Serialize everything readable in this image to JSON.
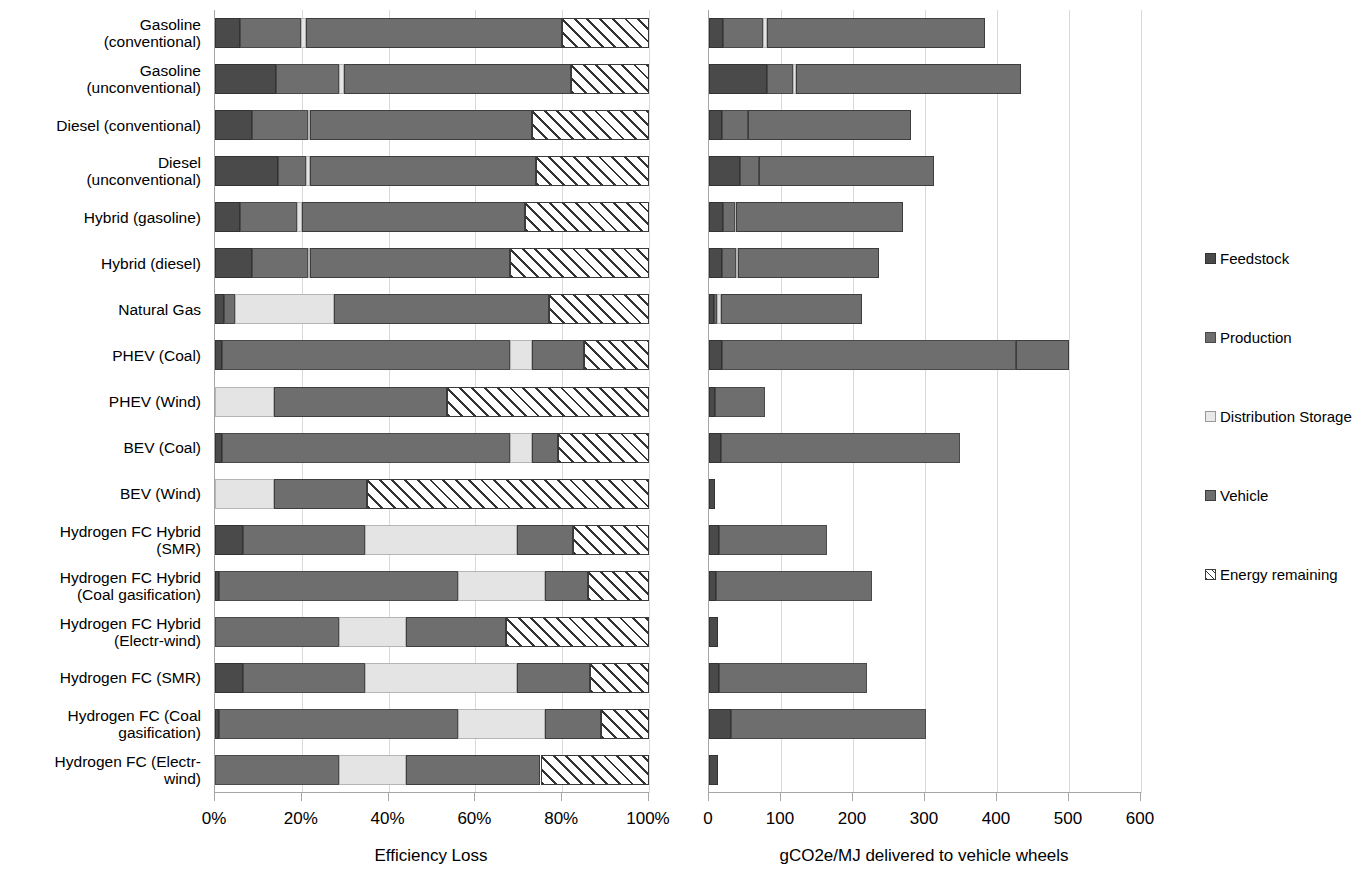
{
  "chart_data": {
    "type": "bar",
    "subtype": "horizontal stacked bar, two panels",
    "title": "",
    "categories": [
      "Gasoline (conventional)",
      "Gasoline (unconventional)",
      "Diesel (conventional)",
      "Diesel (unconventional)",
      "Hybrid (gasoline)",
      "Hybrid (diesel)",
      "Natural Gas",
      "PHEV (Coal)",
      "PHEV (Wind)",
      "BEV (Coal)",
      "BEV (Wind)",
      "Hydrogen FC Hybrid (SMR)",
      "Hydrogen FC Hybrid (Coal gasification)",
      "Hydrogen FC Hybrid (Electr-wind)",
      "Hydrogen FC (SMR)",
      "Hydrogen FC (Coal gasification)",
      "Hydrogen FC (Electr-wind)"
    ],
    "category_lines": [
      [
        "Gasoline",
        "(conventional)"
      ],
      [
        "Gasoline",
        "(unconventional)"
      ],
      [
        "Diesel (conventional)"
      ],
      [
        "Diesel",
        "(unconventional)"
      ],
      [
        "Hybrid (gasoline)"
      ],
      [
        "Hybrid (diesel)"
      ],
      [
        "Natural Gas"
      ],
      [
        "PHEV (Coal)"
      ],
      [
        "PHEV (Wind)"
      ],
      [
        "BEV (Coal)"
      ],
      [
        "BEV (Wind)"
      ],
      [
        "Hydrogen FC Hybrid",
        "(SMR)"
      ],
      [
        "Hydrogen FC Hybrid",
        "(Coal gasification)"
      ],
      [
        "Hydrogen FC Hybrid",
        "(Electr-wind)"
      ],
      [
        "Hydrogen FC (SMR)"
      ],
      [
        "Hydrogen FC (Coal",
        "gasification)"
      ],
      [
        "Hydrogen FC (Electr-",
        "wind)"
      ]
    ],
    "legend": {
      "position": "right",
      "entries": [
        {
          "label": "Feedstock",
          "key": "feedstock",
          "color": "#4a4a4a"
        },
        {
          "label": "Production",
          "key": "production",
          "color": "#6e6e6e"
        },
        {
          "label": "Distribution Storage",
          "key": "storage",
          "color": "#e4e4e4"
        },
        {
          "label": "Vehicle",
          "key": "vehicle",
          "color": "#6e6e6e"
        },
        {
          "label": "Energy remaining",
          "key": "remaining",
          "color": "#ffffff"
        }
      ]
    },
    "panels": [
      {
        "id": "efficiency",
        "xlabel": "Efficiency Loss",
        "xlim": [
          0,
          100
        ],
        "unit": "%",
        "ticks": [
          0,
          20,
          40,
          60,
          80,
          100
        ],
        "ticklabels": [
          "0%",
          "20%",
          "40%",
          "60%",
          "80%",
          "100%"
        ],
        "grid": true,
        "series_order": [
          "Feedstock",
          "Production",
          "Distribution Storage",
          "Vehicle",
          "Energy remaining"
        ],
        "values": [
          {
            "category": "Gasoline (conventional)",
            "feedstock": 5.8,
            "production": 14.0,
            "storage": 1.2,
            "vehicle": 59.0,
            "remaining": 20.0
          },
          {
            "category": "Gasoline (unconventional)",
            "feedstock": 14.0,
            "production": 14.5,
            "storage": 1.2,
            "vehicle": 52.3,
            "remaining": 18.0
          },
          {
            "category": "Diesel (conventional)",
            "feedstock": 8.5,
            "production": 13.0,
            "storage": 0.5,
            "vehicle": 51.0,
            "remaining": 27.0
          },
          {
            "category": "Diesel (unconventional)",
            "feedstock": 14.5,
            "production": 6.5,
            "storage": 1.0,
            "vehicle": 52.0,
            "remaining": 26.0
          },
          {
            "category": "Hybrid (gasoline)",
            "feedstock": 5.8,
            "production": 13.0,
            "storage": 1.2,
            "vehicle": 51.5,
            "remaining": 28.5
          },
          {
            "category": "Hybrid (diesel)",
            "feedstock": 8.5,
            "production": 13.0,
            "storage": 0.5,
            "vehicle": 46.0,
            "remaining": 32.0
          },
          {
            "category": "Natural Gas",
            "feedstock": 2.0,
            "production": 2.5,
            "storage": 23.0,
            "vehicle": 49.5,
            "remaining": 23.0
          },
          {
            "category": "PHEV (Coal)",
            "feedstock": 1.5,
            "production": 66.5,
            "storage": 5.0,
            "vehicle": 12.0,
            "remaining": 15.0
          },
          {
            "category": "PHEV (Wind)",
            "feedstock": 0.0,
            "production": 0.0,
            "storage": 13.5,
            "vehicle": 40.0,
            "remaining": 46.5
          },
          {
            "category": "BEV (Coal)",
            "feedstock": 1.5,
            "production": 66.5,
            "storage": 5.0,
            "vehicle": 6.0,
            "remaining": 21.0
          },
          {
            "category": "BEV (Wind)",
            "feedstock": 0.0,
            "production": 0.0,
            "storage": 13.5,
            "vehicle": 21.5,
            "remaining": 65.0
          },
          {
            "category": "Hydrogen FC Hybrid (SMR)",
            "feedstock": 6.5,
            "production": 28.0,
            "storage": 35.0,
            "vehicle": 13.0,
            "remaining": 17.5
          },
          {
            "category": "Hydrogen FC Hybrid (Coal gasification)",
            "feedstock": 1.0,
            "production": 55.0,
            "storage": 20.0,
            "vehicle": 10.0,
            "remaining": 14.0
          },
          {
            "category": "Hydrogen FC Hybrid (Electr-wind)",
            "feedstock": 0.0,
            "production": 28.5,
            "storage": 15.5,
            "vehicle": 23.0,
            "remaining": 33.0
          },
          {
            "category": "Hydrogen FC (SMR)",
            "feedstock": 6.5,
            "production": 28.0,
            "storage": 35.0,
            "vehicle": 17.0,
            "remaining": 13.5
          },
          {
            "category": "Hydrogen FC (Coal gasification)",
            "feedstock": 1.0,
            "production": 55.0,
            "storage": 20.0,
            "vehicle": 13.0,
            "remaining": 11.0
          },
          {
            "category": "Hydrogen FC (Electr-wind)",
            "feedstock": 0.0,
            "production": 28.5,
            "storage": 15.5,
            "vehicle": 31.0,
            "remaining": 25.0
          }
        ]
      },
      {
        "id": "emissions",
        "xlabel": "gCO2e/MJ delivered to vehicle wheels",
        "xlim": [
          0,
          600
        ],
        "unit": "gCO2e/MJ",
        "ticks": [
          0,
          100,
          200,
          300,
          400,
          500,
          600
        ],
        "ticklabels": [
          "0",
          "100",
          "200",
          "300",
          "400",
          "500",
          "600"
        ],
        "grid": true,
        "series_order": [
          "Feedstock",
          "Production",
          "Distribution Storage",
          "Vehicle",
          "Energy remaining"
        ],
        "values": [
          {
            "category": "Gasoline (conventional)",
            "feedstock": 20,
            "production": 55,
            "storage": 5,
            "vehicle": 303,
            "total": 383
          },
          {
            "category": "Gasoline (unconventional)",
            "feedstock": 80,
            "production": 36,
            "storage": 5,
            "vehicle": 312,
            "total": 433
          },
          {
            "category": "Diesel (conventional)",
            "feedstock": 18,
            "production": 36,
            "storage": 0,
            "vehicle": 226,
            "total": 280
          },
          {
            "category": "Diesel (unconventional)",
            "feedstock": 43,
            "production": 26,
            "storage": 0,
            "vehicle": 244,
            "total": 313
          },
          {
            "category": "Hybrid (gasoline)",
            "feedstock": 20,
            "production": 16,
            "storage": 1,
            "vehicle": 233,
            "total": 270
          },
          {
            "category": "Hybrid (diesel)",
            "feedstock": 18,
            "production": 20,
            "storage": 2,
            "vehicle": 196,
            "total": 236
          },
          {
            "category": "Natural Gas",
            "feedstock": 7,
            "production": 4,
            "storage": 6,
            "vehicle": 196,
            "total": 213
          },
          {
            "category": "PHEV (Coal)",
            "feedstock": 18,
            "production": 408,
            "storage": 0,
            "vehicle": 74,
            "total": 500
          },
          {
            "category": "PHEV (Wind)",
            "feedstock": 8,
            "production": 70,
            "storage": 0,
            "vehicle": 0,
            "total": 78
          },
          {
            "category": "BEV (Coal)",
            "feedstock": 16,
            "production": 333,
            "storage": 0,
            "vehicle": 0,
            "total": 349
          },
          {
            "category": "BEV (Wind)",
            "feedstock": 8,
            "production": 0,
            "storage": 0,
            "vehicle": 0,
            "total": 8
          },
          {
            "category": "Hydrogen FC Hybrid (SMR)",
            "feedstock": 14,
            "production": 150,
            "storage": 0,
            "vehicle": 0,
            "total": 164
          },
          {
            "category": "Hydrogen FC Hybrid (Coal gasification)",
            "feedstock": 10,
            "production": 216,
            "storage": 0,
            "vehicle": 0,
            "total": 226
          },
          {
            "category": "Hydrogen FC Hybrid (Electr-wind)",
            "feedstock": 13,
            "production": 0,
            "storage": 0,
            "vehicle": 0,
            "total": 13
          },
          {
            "category": "Hydrogen FC (SMR)",
            "feedstock": 14,
            "production": 206,
            "storage": 0,
            "vehicle": 0,
            "total": 220
          },
          {
            "category": "Hydrogen FC (Coal gasification)",
            "feedstock": 30,
            "production": 271,
            "storage": 0,
            "vehicle": 0,
            "total": 301
          },
          {
            "category": "Hydrogen FC (Electr-wind)",
            "feedstock": 13,
            "production": 0,
            "storage": 0,
            "vehicle": 0,
            "total": 13
          }
        ]
      }
    ]
  }
}
